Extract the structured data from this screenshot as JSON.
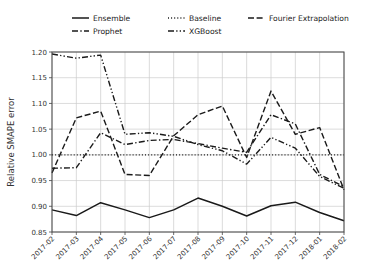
{
  "chart_data": {
    "type": "line",
    "title": "",
    "xlabel": "",
    "ylabel": "Relative SMAPE error",
    "ylim": [
      0.85,
      1.2
    ],
    "yticks": [
      "0.85",
      "0.90",
      "0.95",
      "1.00",
      "1.05",
      "1.10",
      "1.15",
      "1.20"
    ],
    "ytick_values": [
      0.85,
      0.9,
      0.95,
      1.0,
      1.05,
      1.1,
      1.15,
      1.2
    ],
    "grid": true,
    "legend_position": "above-axes",
    "categories": [
      "2017-02",
      "2017-03",
      "2017-04",
      "2017-05",
      "2017-06",
      "2017-07",
      "2017-08",
      "2017-09",
      "2017-10",
      "2017-11",
      "2017-12",
      "2018-01",
      "2018-02"
    ],
    "series": [
      {
        "name": "Ensemble",
        "linestyle": "solid",
        "color": "#1a1a1a",
        "values": [
          0.893,
          0.882,
          0.907,
          0.893,
          0.878,
          0.893,
          0.916,
          0.9,
          0.881,
          0.901,
          0.908,
          0.888,
          0.872
        ]
      },
      {
        "name": "Baseline",
        "linestyle": "dotted",
        "color": "#1a1a1a",
        "values": [
          1.0,
          1.0,
          1.0,
          1.0,
          1.0,
          1.0,
          1.0,
          1.0,
          1.0,
          1.0,
          1.0,
          1.0,
          1.0
        ]
      },
      {
        "name": "Fourier Extrapolation",
        "linestyle": "dashed",
        "color": "#1a1a1a",
        "values": [
          0.965,
          1.072,
          1.085,
          0.962,
          0.96,
          1.037,
          1.078,
          1.095,
          0.995,
          1.124,
          1.04,
          1.053,
          0.932
        ]
      },
      {
        "name": "Prophet",
        "linestyle": "dashdot",
        "color": "#1a1a1a",
        "values": [
          0.974,
          0.975,
          1.043,
          1.02,
          1.028,
          1.03,
          1.022,
          1.013,
          1.005,
          1.078,
          1.06,
          0.962,
          0.938
        ]
      },
      {
        "name": "XGBoost",
        "linestyle": "dashdotdot",
        "color": "#1a1a1a",
        "values": [
          1.196,
          1.188,
          1.194,
          1.04,
          1.043,
          1.036,
          1.02,
          1.008,
          0.982,
          1.034,
          1.013,
          0.958,
          0.935
        ]
      }
    ]
  },
  "legend": {
    "entries": [
      {
        "label": "Ensemble",
        "style": "solid"
      },
      {
        "label": "Baseline",
        "style": "dotted"
      },
      {
        "label": "Fourier Extrapolation",
        "style": "dashed"
      },
      {
        "label": "Prophet",
        "style": "dashdot"
      },
      {
        "label": "XGBoost",
        "style": "dashdotdot"
      }
    ]
  }
}
